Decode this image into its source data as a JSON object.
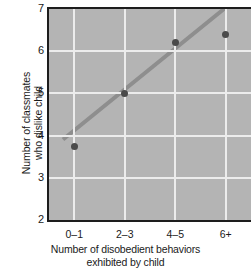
{
  "chart_data": {
    "type": "scatter",
    "title": "",
    "xlabel": "Number of disobedient behaviors exhibited by child",
    "xlabel_line1": "Number of disobedient behaviors",
    "xlabel_line2": "exhibited by child",
    "ylabel": "Number of classmates who dislike child",
    "ylabel_line1": "Number of classmates",
    "ylabel_line2": "who dislike child",
    "categories": [
      "0–1",
      "2–3",
      "4–5",
      "6+"
    ],
    "x": [
      1,
      2,
      3,
      4
    ],
    "values": [
      3.75,
      5.0,
      6.2,
      6.4
    ],
    "series": [
      {
        "name": "Classmates who dislike child",
        "values": [
          3.75,
          5.0,
          6.2,
          6.4
        ]
      }
    ],
    "trendline": {
      "type": "linear",
      "x_start": 0.78,
      "y_start": 3.85,
      "x_end": 4.12,
      "y_end": 7.12,
      "color": "#8e8e8e",
      "width": 4
    },
    "ylim": [
      2,
      7
    ],
    "yticks": [
      2,
      3,
      4,
      5,
      6,
      7
    ],
    "ytick_labels": [
      "2",
      "3",
      "4",
      "5",
      "6",
      "7"
    ],
    "xlim": [
      0.5,
      4.5
    ],
    "grid": true,
    "grid_color": "#ececec",
    "legend": false,
    "plot_background": "#b4b4b4",
    "marker_color": "#4a4a4a",
    "axis_color": "#1d1d1d"
  }
}
